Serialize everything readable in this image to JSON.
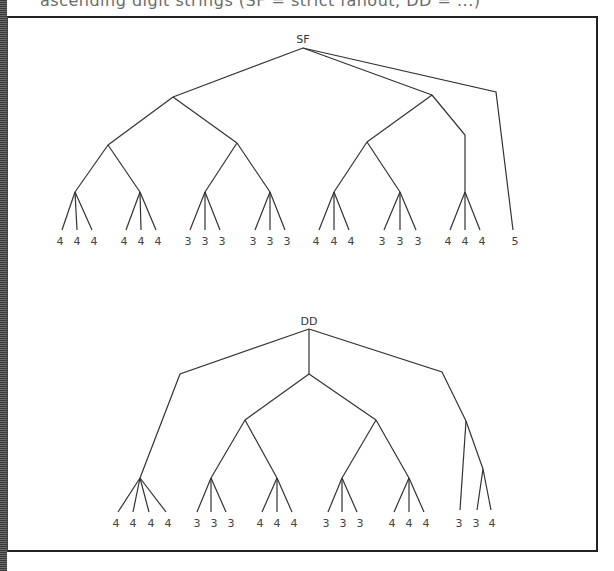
{
  "caption": {
    "partial_text": "ascending digit strings (SF = strict fanout, DD = ...)"
  },
  "trees": [
    {
      "root_label": "SF",
      "leaf_groups": [
        {
          "values": [
            "4",
            "4",
            "4"
          ]
        },
        {
          "values": [
            "4",
            "4",
            "4"
          ]
        },
        {
          "values": [
            "3",
            "3",
            "3"
          ]
        },
        {
          "values": [
            "3",
            "3",
            "3"
          ]
        },
        {
          "values": [
            "4",
            "4",
            "4"
          ]
        },
        {
          "values": [
            "3",
            "3",
            "3"
          ]
        },
        {
          "values": [
            "4",
            "4",
            "4"
          ]
        },
        {
          "values": [
            "5"
          ]
        }
      ]
    },
    {
      "root_label": "DD",
      "leaf_groups": [
        {
          "values": [
            "4",
            "4",
            "4",
            "4"
          ]
        },
        {
          "values": [
            "3",
            "3",
            "3"
          ]
        },
        {
          "values": [
            "4",
            "4",
            "4"
          ]
        },
        {
          "values": [
            "3",
            "3",
            "3"
          ]
        },
        {
          "values": [
            "4",
            "4",
            "4"
          ]
        },
        {
          "values": [
            "3",
            "3",
            "4"
          ]
        }
      ]
    }
  ],
  "colors": {
    "line": "#333333",
    "text": "#444444",
    "frame": "#222222"
  }
}
